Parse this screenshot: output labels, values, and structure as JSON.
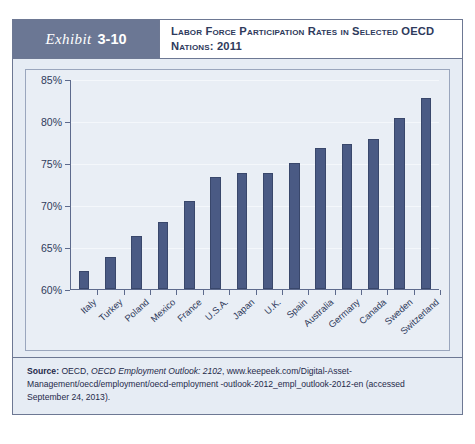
{
  "exhibit": {
    "label": "Exhibit",
    "number": "3-10",
    "title": "Labor Force Participation Rates in Selected OECD Nations: 2011"
  },
  "source": {
    "prefix": "Source:",
    "publisher": "OECD,",
    "work": "OECD Employment Outlook: 2102",
    "rest": ", www.keepeek.com/Digital-Asset-Management/oecd/employment/oecd-employment -outlook-2012_empl_outlook-2012-en (accessed September 24, 2013)."
  },
  "colors": {
    "bar": "#4a5a84",
    "header": "#6b7794",
    "frame": "#6d7893",
    "panel": "#e6ecf4",
    "plot": "#e9eef5"
  },
  "chart_data": {
    "type": "bar",
    "title": "Labor Force Participation Rates in Selected OECD Nations: 2011",
    "xlabel": "",
    "ylabel": "",
    "ylim": [
      60,
      85
    ],
    "yticks": [
      60,
      65,
      70,
      75,
      80,
      85
    ],
    "ytick_labels": [
      "60%",
      "65%",
      "70%",
      "75%",
      "80%",
      "85%"
    ],
    "grid": true,
    "legend": "none",
    "categories": [
      "Italy",
      "Turkey",
      "Poland",
      "Mexico",
      "France",
      "U.S.A.",
      "Japan",
      "U.K.",
      "Spain",
      "Australia",
      "Germany",
      "Canada",
      "Sweden",
      "Switzerland"
    ],
    "values": [
      62.2,
      63.8,
      66.3,
      68.0,
      70.5,
      73.4,
      73.9,
      73.9,
      75.1,
      76.9,
      77.3,
      78.0,
      80.5,
      82.9
    ]
  }
}
